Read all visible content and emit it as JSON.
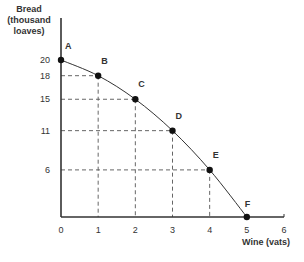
{
  "chart_data": {
    "type": "line",
    "title": "",
    "xlabel": "Wine (vats)",
    "ylabel": "Bread (thousand loaves)",
    "ylabel_lines": [
      "Bread",
      "(thousand",
      "loaves)"
    ],
    "xlim": [
      0,
      6
    ],
    "ylim": [
      0,
      20
    ],
    "x_ticks": [
      0,
      1,
      2,
      3,
      4,
      5,
      6
    ],
    "y_ticks": [
      6,
      11,
      15,
      18,
      20
    ],
    "grid": false,
    "legend": null,
    "series": [
      {
        "name": "Production possibilities frontier",
        "points": [
          {
            "label": "A",
            "x": 0,
            "y": 20
          },
          {
            "label": "B",
            "x": 1,
            "y": 18
          },
          {
            "label": "C",
            "x": 2,
            "y": 15
          },
          {
            "label": "D",
            "x": 3,
            "y": 11
          },
          {
            "label": "E",
            "x": 4,
            "y": 6
          },
          {
            "label": "F",
            "x": 5,
            "y": 0
          }
        ]
      }
    ],
    "annotations": [
      "Dashed reference lines drop from points B–E to both axes"
    ]
  },
  "colors": {
    "axis": "#333333",
    "curve": "#333333",
    "dash": "#555555",
    "point": "#111111",
    "text": "#333333"
  }
}
